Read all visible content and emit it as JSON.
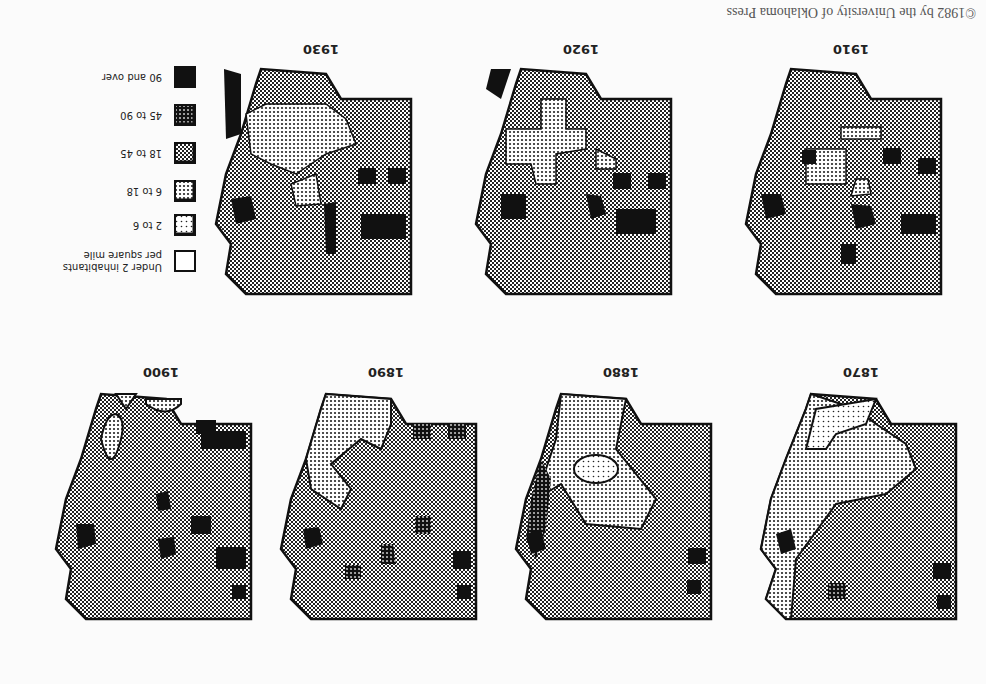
{
  "figure": {
    "credit": "©1982 by the University of Oklahoma Press",
    "maps": [
      {
        "year": "1870"
      },
      {
        "year": "1880"
      },
      {
        "year": "1890"
      },
      {
        "year": "1900"
      },
      {
        "year": "1910"
      },
      {
        "year": "1920"
      },
      {
        "year": "1930"
      }
    ]
  },
  "legend": {
    "title": "Population density",
    "items": [
      {
        "label": "Under 2 inhabitants",
        "label2": "per square mile",
        "pattern": "empty"
      },
      {
        "label": "2 to 6",
        "pattern": "sparse-dots"
      },
      {
        "label": "6 to 18",
        "pattern": "light-dots"
      },
      {
        "label": "18 to 45",
        "pattern": "medium-check"
      },
      {
        "label": "45 to 90",
        "pattern": "dense-dots"
      },
      {
        "label": "90 and over",
        "pattern": "solid"
      }
    ],
    "colors": {
      "ink": "#111111",
      "paper": "#ffffff"
    }
  }
}
